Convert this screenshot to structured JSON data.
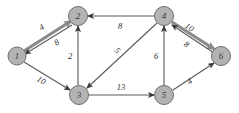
{
  "graph": {
    "title": "directed weighted graph",
    "background_color": "#ffffff",
    "node_fill": "#b3b3b3",
    "node_stroke": "#6e6e6e",
    "edge_color": "#5a5a5a",
    "edge_highlight_color": "#8a8a8a",
    "nodes": [
      {
        "id": "1",
        "label": "1",
        "x": 17,
        "y": 56,
        "r": 9
      },
      {
        "id": "2",
        "label": "2",
        "x": 78,
        "y": 16,
        "r": 9.5
      },
      {
        "id": "3",
        "label": "3",
        "x": 79,
        "y": 95,
        "r": 9.5
      },
      {
        "id": "4",
        "label": "4",
        "x": 164,
        "y": 16,
        "r": 9.5
      },
      {
        "id": "5",
        "label": "5",
        "x": 164,
        "y": 95,
        "r": 9.5
      },
      {
        "id": "6",
        "label": "6",
        "x": 221,
        "y": 56,
        "r": 9.5
      }
    ],
    "edges": [
      {
        "id": "e-1-2",
        "from": "1",
        "to": "2",
        "weight": "4",
        "style": "thick",
        "x1": 24,
        "y1": 51,
        "x2": 71,
        "y2": 21,
        "lx": 42,
        "ly": 28,
        "rot": -32
      },
      {
        "id": "e-2-1",
        "from": "2",
        "to": "1",
        "weight": "8",
        "style": "thin",
        "x1": 72,
        "y1": 25,
        "x2": 25,
        "y2": 54,
        "lx": 57,
        "ly": 43,
        "rot": -32
      },
      {
        "id": "e-1-3",
        "from": "1",
        "to": "3",
        "weight": "10",
        "style": "thin",
        "x1": 24,
        "y1": 62,
        "x2": 70,
        "y2": 90,
        "lx": 41,
        "ly": 81,
        "rot": 31
      },
      {
        "id": "e-3-2",
        "from": "3",
        "to": "2",
        "weight": "2",
        "style": "thin",
        "x1": 78,
        "y1": 85,
        "x2": 78,
        "y2": 26,
        "lx": 70,
        "ly": 57,
        "rot": 0
      },
      {
        "id": "e-4-2",
        "from": "4",
        "to": "2",
        "weight": "8",
        "style": "thin",
        "x1": 154,
        "y1": 16,
        "x2": 88,
        "y2": 16,
        "lx": 120,
        "ly": 27,
        "rot": 0
      },
      {
        "id": "e-4-3",
        "from": "4",
        "to": "3",
        "weight": "5",
        "style": "thin",
        "x1": 157,
        "y1": 23,
        "x2": 87,
        "y2": 88,
        "lx": 117,
        "ly": 51,
        "rot": 43
      },
      {
        "id": "e-5-4",
        "from": "5",
        "to": "4",
        "weight": "6",
        "style": "thin",
        "x1": 164,
        "y1": 85,
        "x2": 164,
        "y2": 26,
        "lx": 156,
        "ly": 57,
        "rot": 0
      },
      {
        "id": "e-4-6",
        "from": "4",
        "to": "6",
        "weight": "10",
        "style": "thick",
        "x1": 172,
        "y1": 22,
        "x2": 214,
        "y2": 49,
        "lx": 189,
        "ly": 28,
        "rot": 33
      },
      {
        "id": "e-6-4",
        "from": "6",
        "to": "4",
        "weight": "8",
        "style": "thin",
        "x1": 214,
        "y1": 53,
        "x2": 172,
        "y2": 25,
        "lx": 186,
        "ly": 45,
        "rot": 33
      },
      {
        "id": "e-3-5",
        "from": "3",
        "to": "5",
        "weight": "13",
        "style": "thin",
        "x1": 89,
        "y1": 95,
        "x2": 154,
        "y2": 95,
        "lx": 121,
        "ly": 88,
        "rot": 0
      },
      {
        "id": "e-5-6",
        "from": "5",
        "to": "6",
        "weight": "4",
        "style": "thin",
        "x1": 173,
        "y1": 90,
        "x2": 214,
        "y2": 63,
        "lx": 190,
        "ly": 82,
        "rot": -33
      }
    ]
  }
}
